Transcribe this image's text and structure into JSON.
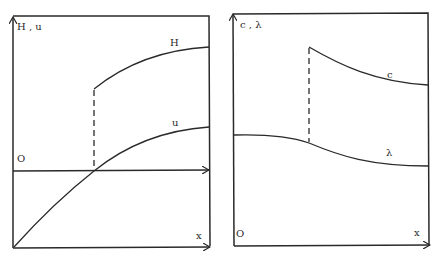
{
  "left_panel": {
    "y_axis_label": "H , u",
    "x_axis_label": "x",
    "origin_label": "O",
    "curves": [
      {
        "name": "H",
        "label": "H"
      },
      {
        "name": "u",
        "label": "u"
      }
    ]
  },
  "right_panel": {
    "y_axis_label": "c , λ",
    "x_axis_label": "x",
    "origin_label": "O",
    "curves": [
      {
        "name": "c",
        "label": "c"
      },
      {
        "name": "lambda",
        "label": "λ"
      }
    ]
  },
  "colors": {
    "ink": "#2a2a2a",
    "background": "#ffffff"
  }
}
